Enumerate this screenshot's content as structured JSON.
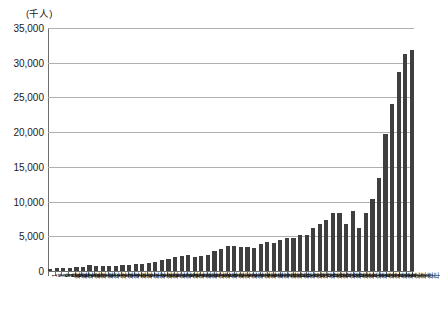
{
  "axis": {
    "unit_label": "(千人)",
    "y_ticks": [
      "35,000",
      "30,000",
      "25,000",
      "20,000",
      "15,000",
      "10,000",
      "5,000",
      "0"
    ]
  },
  "chart_data": {
    "type": "bar",
    "title": "",
    "subtitle": "",
    "xlabel": "",
    "ylabel": "(千人)",
    "ylim": [
      0,
      35000
    ],
    "ytick_values": [
      0,
      5000,
      10000,
      15000,
      20000,
      25000,
      30000,
      35000
    ],
    "grid": true,
    "legend": "none",
    "bar_color": "#3f3f3f",
    "categories": [
      "1964年",
      "1965年",
      "1966年",
      "1967年",
      "1968年",
      "1969年",
      "1970年",
      "1971年",
      "1972年",
      "1973年",
      "1974年",
      "1975年",
      "1976年",
      "1977年",
      "1978年",
      "1979年",
      "1980年",
      "1981年",
      "1982年",
      "1983年",
      "1984年",
      "1985年",
      "1986年",
      "1987年",
      "1988年",
      "1989年",
      "1990年",
      "1991年",
      "1992年",
      "1993年",
      "1994年",
      "1995年",
      "1996年",
      "1997年",
      "1998年",
      "1999年",
      "2000年",
      "2001年",
      "2002年",
      "2003年",
      "2004年",
      "2005年",
      "2006年",
      "2007年",
      "2008年",
      "2009年",
      "2010年",
      "2011年",
      "2012年",
      "2013年",
      "2014年",
      "2015年",
      "2016年",
      "2017年",
      "2018年",
      "2019年"
    ],
    "values": [
      352,
      367,
      433,
      477,
      519,
      609,
      854,
      661,
      724,
      785,
      764,
      812,
      915,
      1026,
      1039,
      1113,
      1317,
      1583,
      1793,
      1968,
      2111,
      2327,
      2061,
      2155,
      2355,
      2835,
      3236,
      3533,
      3581,
      3410,
      3468,
      3345,
      3837,
      4218,
      4106,
      4438,
      4757,
      4772,
      5239,
      5212,
      6138,
      6728,
      7334,
      8347,
      8351,
      6790,
      8611,
      6219,
      8358,
      10364,
      13413,
      19737,
      24039,
      28691,
      31192,
      31882
    ]
  }
}
